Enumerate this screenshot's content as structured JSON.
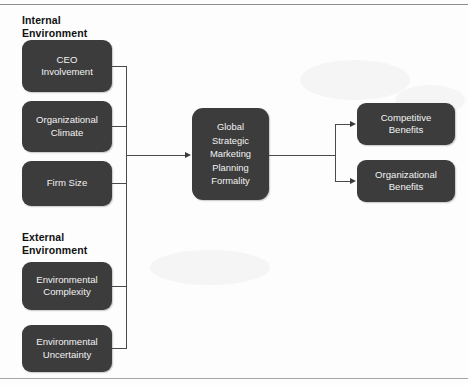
{
  "figure": {
    "width": 468,
    "height": 385,
    "background_color": "#fdfdfd",
    "box_fill_color": "#3c3c3c",
    "box_text_color": "#f2f2f2",
    "connector_color": "#4a4a4a",
    "rule_color": "#9a9a9a"
  },
  "sections": [
    {
      "id": "internal",
      "heading": "Internal\nEnvironment"
    },
    {
      "id": "external",
      "heading": "External\nEnvironment"
    }
  ],
  "antecedents": [
    {
      "id": "ceo-involvement",
      "label": "CEO\nInvolvement",
      "group": "internal"
    },
    {
      "id": "organizational-climate",
      "label": "Organizational\nClimate",
      "group": "internal"
    },
    {
      "id": "firm-size",
      "label": "Firm Size",
      "group": "internal"
    },
    {
      "id": "environmental-complexity",
      "label": "Environmental\nComplexity",
      "group": "external"
    },
    {
      "id": "environmental-uncertainty",
      "label": "Environmental\nUncertainty",
      "group": "external"
    }
  ],
  "construct": {
    "id": "global-strategic-marketing-planning-formality",
    "label": "Global\nStrategic\nMarketing\nPlanning\nFormality"
  },
  "outcomes": [
    {
      "id": "competitive-benefits",
      "label": "Competitive\nBenefits"
    },
    {
      "id": "organizational-benefits",
      "label": "Organizational\nBenefits"
    }
  ]
}
